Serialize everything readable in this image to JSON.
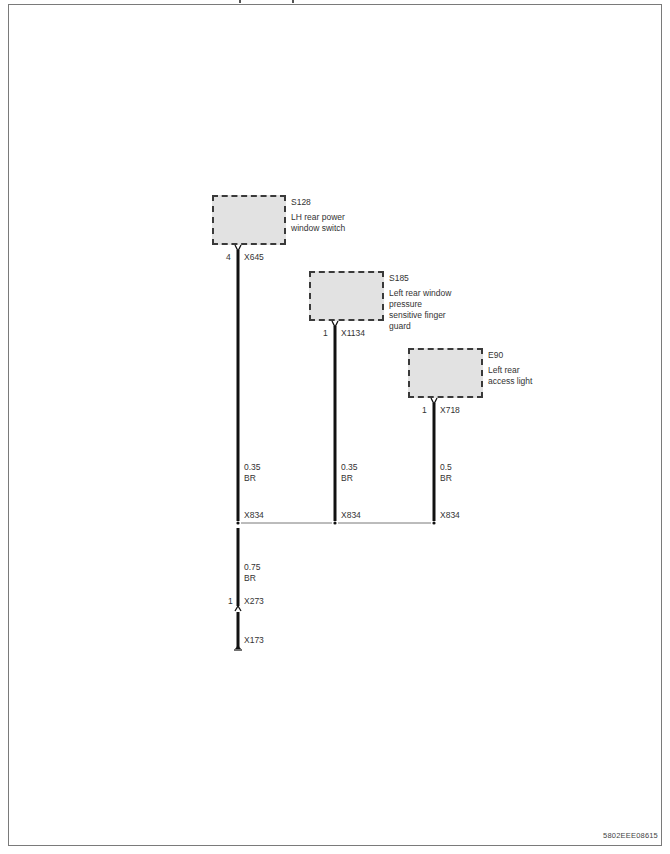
{
  "diagram": {
    "type": "wiring-diagram",
    "components": [
      {
        "id": "S128",
        "description": "LH rear power window switch",
        "pin": "4",
        "connector": "X645",
        "wire_size": "0.35",
        "wire_color": "BR",
        "junction": "X834"
      },
      {
        "id": "S185",
        "description": "Left rear window pressure sensitive finger guard",
        "pin": "1",
        "connector": "X1134",
        "wire_size": "0.35",
        "wire_color": "BR",
        "junction": "X834"
      },
      {
        "id": "E90",
        "description": "Left rear access light",
        "pin": "1",
        "connector": "X718",
        "wire_size": "0.5",
        "wire_color": "BR",
        "junction": "X834"
      }
    ],
    "labels": {
      "s128_id": "S128",
      "s128_desc_1": "LH rear power",
      "s128_desc_2": "window switch",
      "s128_pin": "4",
      "s128_conn": "X645",
      "s185_id": "S185",
      "s185_desc_1": "Left rear window",
      "s185_desc_2": "pressure",
      "s185_desc_3": "sensitive finger",
      "s185_desc_4": "guard",
      "s185_pin": "1",
      "s185_conn": "X1134",
      "e90_id": "E90",
      "e90_desc_1": "Left rear",
      "e90_desc_2": "access light",
      "e90_pin": "1",
      "e90_conn": "X718",
      "w1_size": "0.35",
      "w1_color": "BR",
      "w2_size": "0.35",
      "w2_color": "BR",
      "w3_size": "0.5",
      "w3_color": "BR",
      "j1": "X834",
      "j2": "X834",
      "j3": "X834",
      "main_size": "0.75",
      "main_color": "BR",
      "x273_pin": "1",
      "x273": "X273",
      "x173": "X173"
    },
    "colors": {
      "wire": "#111111",
      "component_fill": "#e2e2e2",
      "component_border": "#3a3a3a",
      "frame": "#7a7a7a"
    },
    "document_id": "5802EEE08615"
  }
}
